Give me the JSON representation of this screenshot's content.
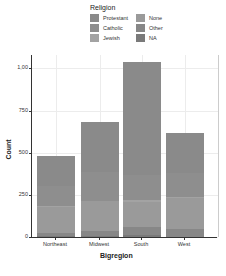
{
  "chart_data": {
    "type": "bar",
    "stacked": true,
    "title": "",
    "xlabel": "Bigregion",
    "ylabel": "Count",
    "ylim": [
      0,
      1080
    ],
    "yticks": [
      0,
      250,
      500,
      750,
      1000
    ],
    "ytick_labels": [
      "0",
      "250",
      "500",
      "750",
      "1,00"
    ],
    "categories": [
      "Northeast",
      "Midwest",
      "South",
      "West"
    ],
    "legend_title": "Religion",
    "legend_position": "top",
    "series": [
      {
        "name": "NA",
        "color": "#7a7a7a",
        "values": [
          5,
          5,
          11,
          1
        ]
      },
      {
        "name": "Other",
        "color": "#878787",
        "values": [
          17,
          33,
          47,
          48
        ]
      },
      {
        "name": "None",
        "color": "#9a9a9a",
        "values": [
          156,
          174,
          150,
          180
        ]
      },
      {
        "name": "Jewish",
        "color": "#a3a3a3",
        "values": [
          4,
          3,
          10,
          6
        ]
      },
      {
        "name": "Catholic",
        "color": "#8e8e8e",
        "values": [
          120,
          170,
          150,
          144
        ]
      },
      {
        "name": "Protestant",
        "color": "#8a8a8a",
        "values": [
          180,
          300,
          668,
          240
        ]
      }
    ],
    "totals": [
      482,
      685,
      1036,
      619
    ],
    "grid": true
  },
  "legend": {
    "title": "Religion",
    "items": [
      {
        "label": "Protestant",
        "color": "#8a8a8a"
      },
      {
        "label": "None",
        "color": "#9a9a9a"
      },
      {
        "label": "Catholic",
        "color": "#8e8e8e"
      },
      {
        "label": "Other",
        "color": "#878787"
      },
      {
        "label": "Jewish",
        "color": "#a3a3a3"
      },
      {
        "label": "NA",
        "color": "#7a7a7a"
      }
    ]
  },
  "axes": {
    "x_title": "Bigregion",
    "y_title": "Count",
    "x_ticks": [
      "Northeast",
      "Midwest",
      "South",
      "West"
    ],
    "y_ticks": [
      "0",
      "250",
      "500",
      "750",
      "1,00"
    ]
  }
}
